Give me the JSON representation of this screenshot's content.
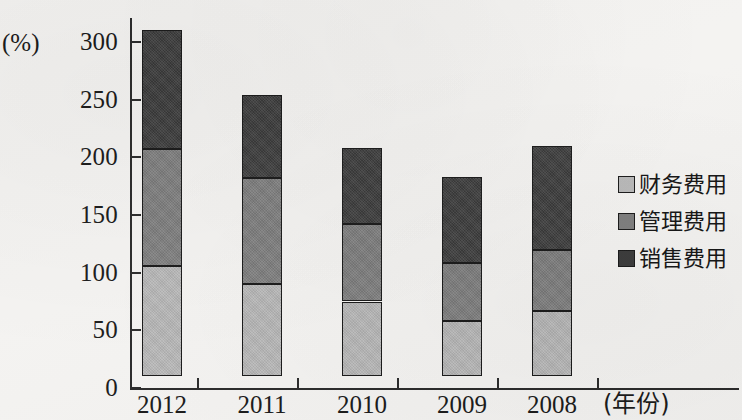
{
  "chart_data": {
    "type": "bar",
    "subtype": "stacked-vertical",
    "title": "",
    "xlabel": "(年份)",
    "ylabel": "(%)",
    "categories": [
      "2012",
      "2011",
      "2010",
      "2009",
      "2008"
    ],
    "series": [
      {
        "name": "财务费用",
        "color": "#b9b9b9",
        "values": [
          96,
          80,
          65,
          48,
          57
        ]
      },
      {
        "name": "管理费用",
        "color": "#7e7e7e",
        "values": [
          101,
          92,
          67,
          50,
          53
        ]
      },
      {
        "name": "销售费用",
        "color": "#3b3b3b",
        "values": [
          103,
          72,
          66,
          75,
          90
        ]
      }
    ],
    "stack_base": 10,
    "stack_tops": [
      310,
      254,
      208,
      183,
      210
    ],
    "ylim": [
      0,
      320
    ],
    "yticks": [
      0,
      50,
      100,
      150,
      200,
      250,
      300
    ],
    "ytick_labels": [
      "0",
      "50",
      "100",
      "150",
      "200",
      "250",
      "300"
    ],
    "grid": false,
    "legend_position": "right"
  },
  "axes": {
    "y_unit_label": "(%)",
    "x_unit_label": "(年份)",
    "y_ticks": [
      {
        "label": "300",
        "value": 300
      },
      {
        "label": "250",
        "value": 250
      },
      {
        "label": "200",
        "value": 200
      },
      {
        "label": "150",
        "value": 150
      },
      {
        "label": "100",
        "value": 100
      },
      {
        "label": "50",
        "value": 50
      },
      {
        "label": "0",
        "value": 0
      }
    ],
    "x_ticks": [
      {
        "label": "2012"
      },
      {
        "label": "2011"
      },
      {
        "label": "2010"
      },
      {
        "label": "2009"
      },
      {
        "label": "2008"
      }
    ]
  },
  "legend": {
    "items": [
      {
        "label": "财务费用",
        "color": "#b9b9b9",
        "swatch": "light-gray-swatch-icon"
      },
      {
        "label": "管理费用",
        "color": "#7e7e7e",
        "swatch": "medium-gray-swatch-icon"
      },
      {
        "label": "销售费用",
        "color": "#3b3b3b",
        "swatch": "dark-gray-swatch-icon"
      }
    ]
  }
}
